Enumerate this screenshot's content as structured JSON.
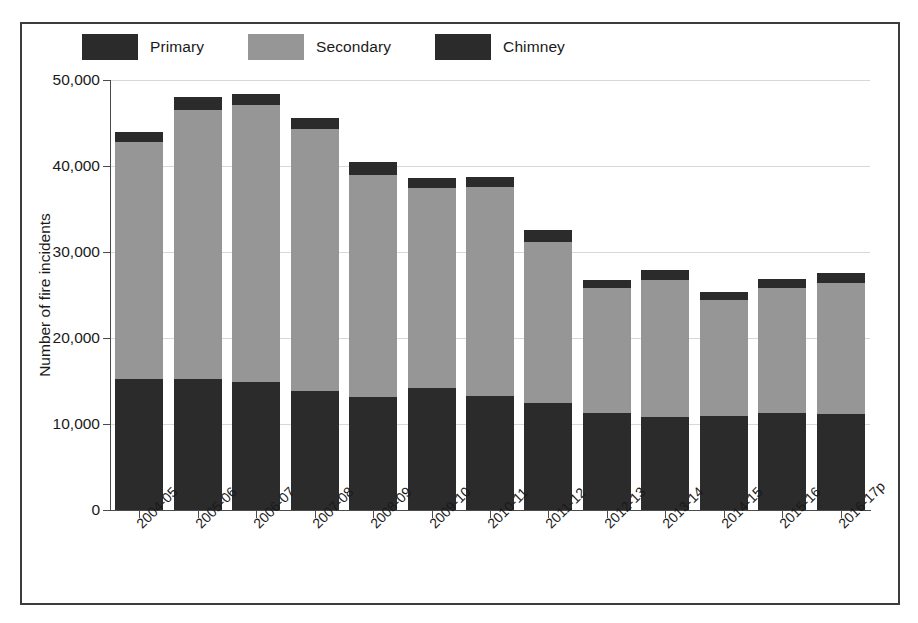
{
  "chart_data": {
    "type": "bar",
    "stacked": true,
    "title": "",
    "xlabel": "",
    "ylabel": "Number of fire incidents",
    "ylim": [
      0,
      50000
    ],
    "yticks": [
      0,
      10000,
      20000,
      30000,
      40000,
      50000
    ],
    "ytick_labels": [
      "0",
      "10,000",
      "20,000",
      "30,000",
      "40,000",
      "50,000"
    ],
    "grid": true,
    "legend_position": "top-left",
    "categories": [
      "2004-05",
      "2005-06",
      "2006-07",
      "2007-08",
      "2008-09",
      "2009-10",
      "2010-11",
      "2011-12",
      "2012-13",
      "2013-14",
      "2014-15",
      "2015-16",
      "2016-17p"
    ],
    "series": [
      {
        "name": "Primary",
        "color": "#2b2b2b",
        "values": [
          15200,
          15200,
          14900,
          13800,
          13100,
          14200,
          13300,
          12500,
          11300,
          10800,
          10900,
          11300,
          11200
        ]
      },
      {
        "name": "Secondary",
        "color": "#969696",
        "values": [
          27600,
          31300,
          32200,
          30500,
          25900,
          23300,
          24300,
          18700,
          14500,
          16000,
          13500,
          14500,
          15200
        ]
      },
      {
        "name": "Chimney",
        "color": "#2b2b2b",
        "values": [
          1200,
          1500,
          1300,
          1300,
          1500,
          1100,
          1100,
          1400,
          900,
          1100,
          900,
          1100,
          1200
        ]
      }
    ],
    "totals": [
      44000,
      48000,
      48400,
      45600,
      40500,
      38600,
      38700,
      32600,
      26700,
      27900,
      25300,
      26900,
      27600
    ]
  },
  "legend": {
    "items": [
      {
        "label": "Primary",
        "swatch": "legend-swatch-primary"
      },
      {
        "label": "Secondary",
        "swatch": "legend-swatch-secondary"
      },
      {
        "label": "Chimney",
        "swatch": "legend-swatch-chimney"
      }
    ]
  }
}
